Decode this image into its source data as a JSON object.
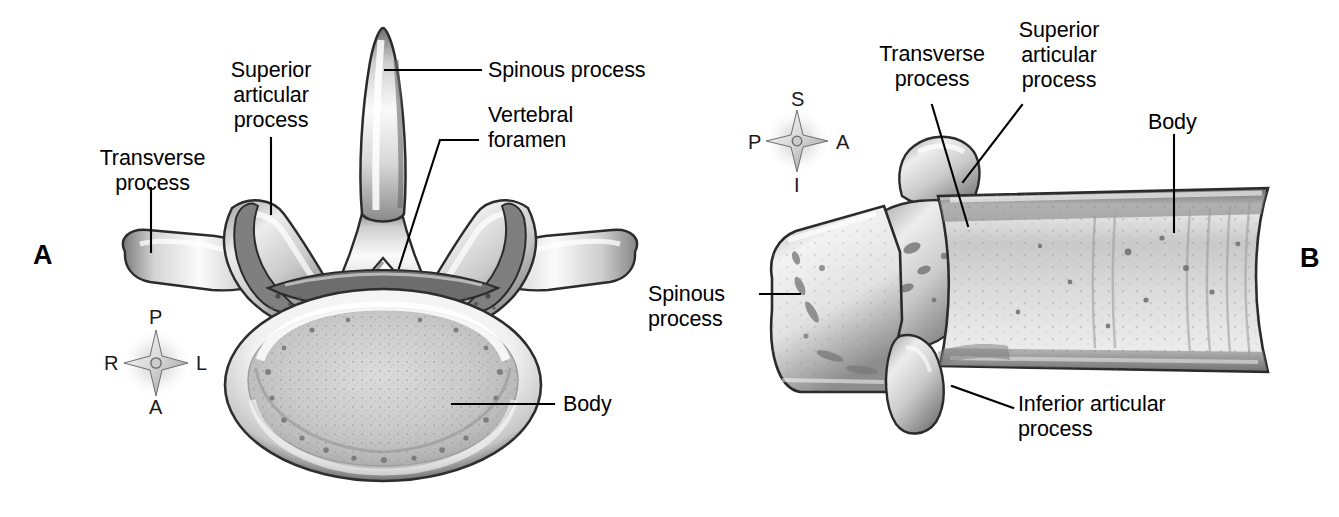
{
  "figure": {
    "background_color": "#ffffff",
    "line_color": "#000000"
  },
  "panels": [
    {
      "id": "A",
      "letter": "A",
      "view": "superior view of lumbar vertebra",
      "labels": [
        {
          "name": "transverse-process",
          "text": "Transverse\nprocess"
        },
        {
          "name": "superior-articular-process",
          "text": "Superior\narticular\nprocess"
        },
        {
          "name": "spinous-process",
          "text": "Spinous process"
        },
        {
          "name": "vertebral-foramen",
          "text": "Vertebral\nforamen"
        },
        {
          "name": "body",
          "text": "Body"
        }
      ],
      "compass": {
        "top": "P",
        "left": "R",
        "right": "L",
        "bottom": "A"
      }
    },
    {
      "id": "B",
      "letter": "B",
      "view": "lateral view of lumbar vertebra",
      "labels": [
        {
          "name": "transverse-process",
          "text": "Transverse\nprocess"
        },
        {
          "name": "superior-articular-process",
          "text": "Superior\narticular\nprocess"
        },
        {
          "name": "body",
          "text": "Body"
        },
        {
          "name": "spinous-process",
          "text": "Spinous\nprocess"
        },
        {
          "name": "inferior-articular-process",
          "text": "Inferior articular\nprocess"
        }
      ],
      "compass": {
        "top": "S",
        "left": "P",
        "right": "A",
        "bottom": "I"
      }
    }
  ]
}
